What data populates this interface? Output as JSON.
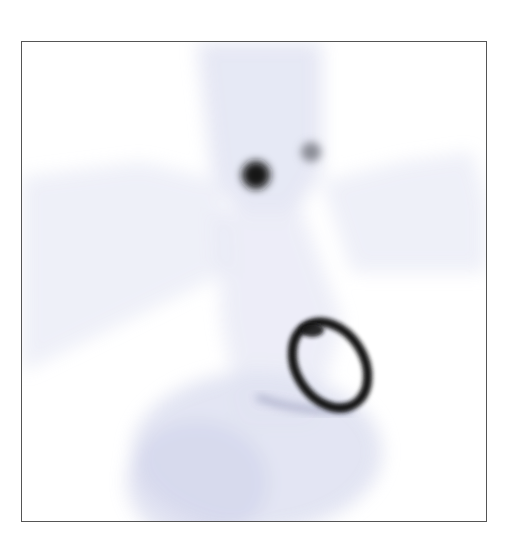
{
  "image": {
    "type": "scintigraphy-scan",
    "description": "Grayscale nuclear medicine image showing faint body outline, two focal uptake spots in the neck region and an elliptical ring-shaped uptake in the chest",
    "colors": {
      "background": "#ffffff",
      "frame_border": "#555555",
      "soft_tissue": "#c9cde6",
      "hot_spot": "#141418"
    },
    "features": [
      {
        "name": "neck-hot-spot-left",
        "cx": 234,
        "cy": 133,
        "r": 16
      },
      {
        "name": "neck-hot-spot-right",
        "cx": 289,
        "cy": 110,
        "r": 11
      },
      {
        "name": "ring-uptake",
        "cx": 308,
        "cy": 325,
        "rx": 38,
        "ry": 50,
        "rotation": -30
      }
    ]
  }
}
